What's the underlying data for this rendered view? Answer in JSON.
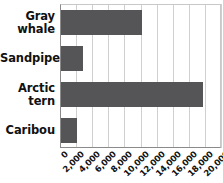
{
  "chart_data": {
    "type": "bar",
    "orientation": "horizontal",
    "title": "",
    "xlabel": "",
    "ylabel": "",
    "categories": [
      "Gray whale",
      "Sandpiper",
      "Arctic tern",
      "Caribou"
    ],
    "values": [
      10000,
      2700,
      17700,
      2000
    ],
    "xlim": [
      0,
      20000
    ],
    "xticks": [
      0,
      2000,
      4000,
      6000,
      8000,
      10000,
      12000,
      14000,
      16000,
      18000,
      20000
    ],
    "xtick_labels": [
      "0",
      "2,000",
      "4,000",
      "6,000",
      "8,000",
      "10,000",
      "12,000",
      "14,000",
      "16,000",
      "18,000",
      "20,000"
    ],
    "grid": true,
    "legend": false,
    "bar_color": "#555558",
    "axis_color": "#8a8a8a",
    "grid_color": "#cfcfcf",
    "text_color": "#111111"
  },
  "category_labels": [
    {
      "lines": [
        "Gray",
        "whale"
      ]
    },
    {
      "lines": [
        "Sandpiper"
      ]
    },
    {
      "lines": [
        "Arctic",
        "tern"
      ]
    },
    {
      "lines": [
        "Caribou"
      ]
    }
  ]
}
